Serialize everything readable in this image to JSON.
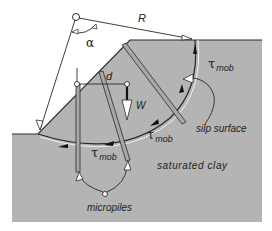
{
  "diagram": {
    "labels": {
      "radius": "R",
      "angle": "α",
      "lever_arm": "d",
      "weight": "W",
      "shear_symbol": "τ",
      "shear_subscript": "mob",
      "slip_surface": "silp surface",
      "soil": "saturated clay",
      "piles": "micropiles"
    },
    "colors": {
      "soil_fill": "#b4b4b4",
      "line": "#2a2a2a",
      "pile_fill": "#a8a8a8",
      "background": "#ffffff"
    }
  }
}
